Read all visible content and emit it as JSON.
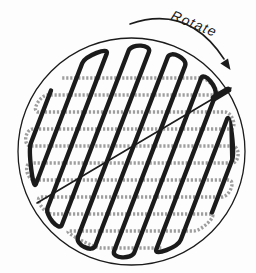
{
  "figure": {
    "rotate_label": "Rotate",
    "colors": {
      "background": "#fdfdfd",
      "ink": "#1b1b1b",
      "gray": "#9e9e9e"
    },
    "disc": {
      "cx": 131.5,
      "cy": 151.5,
      "r": 113.5,
      "outline_width": 1.3
    },
    "gray_raster": {
      "angle_deg": 90,
      "spacing": 17,
      "legs": 11,
      "v_start": -73.5,
      "r_inner": 101,
      "bulge": 8,
      "stroke_width": 3.4,
      "dash": "2.2 1.8",
      "first_turn": "positive"
    },
    "black_raster": {
      "angle_deg": 21,
      "spacing": 19.4,
      "legs": 11,
      "v_start": -97,
      "r_inner": 101,
      "bulge": 8,
      "stroke_width": 4.4,
      "dash": "",
      "first_turn": "negative"
    },
    "scan_line": {
      "x1": 37,
      "y1": 203,
      "x2": 231,
      "y2": 88,
      "width": 1.6
    },
    "head_marker": {
      "x1": 214,
      "y1": 98.1,
      "x2": 228,
      "y2": 89.8,
      "width": 6.5
    },
    "rotate_arrow": {
      "shaft_path": "M 130 24 Q 188 4 224 59",
      "head_points": "230.5,70 220.4,63.6 228,58.4",
      "width": 1.6
    },
    "label_pos": {
      "x": 170,
      "y": 19,
      "angle_deg": 22,
      "font_size": 14,
      "letter_spacing": 1.2
    }
  }
}
